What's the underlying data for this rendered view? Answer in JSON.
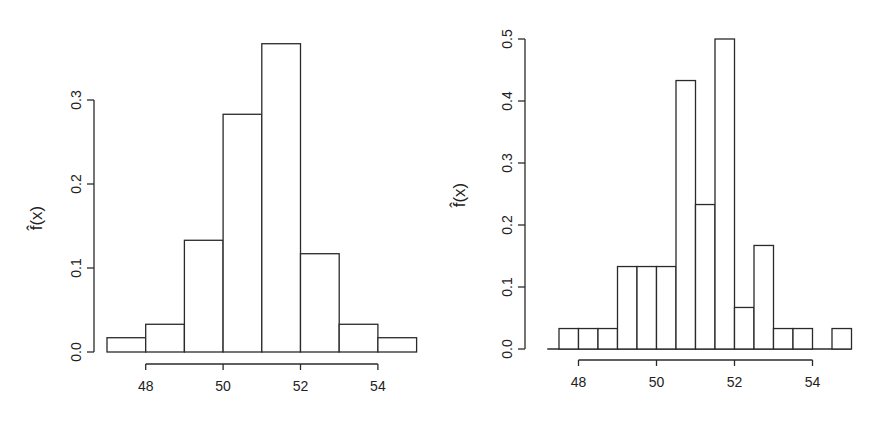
{
  "chart_data": [
    {
      "type": "bar",
      "subtype": "histogram",
      "title": "",
      "xlabel": "",
      "ylabel": "f̂(x)",
      "bin_width": 1,
      "bin_edges": [
        47,
        48,
        49,
        50,
        51,
        52,
        53,
        54,
        55
      ],
      "values": [
        0.017,
        0.033,
        0.133,
        0.283,
        0.367,
        0.117,
        0.033,
        0.017
      ],
      "xticks": [
        48,
        50,
        52,
        54
      ],
      "xtick_labels": [
        "48",
        "50",
        "52",
        "54"
      ],
      "yticks": [
        0.0,
        0.1,
        0.2,
        0.3
      ],
      "ytick_labels": [
        "0.0",
        "0.1",
        "0.2",
        "0.3"
      ],
      "xlim": [
        47,
        55
      ],
      "ylim": [
        0,
        0.37
      ],
      "grid": false
    },
    {
      "type": "bar",
      "subtype": "histogram",
      "title": "",
      "xlabel": "",
      "ylabel": "f̂(x)",
      "bin_width": 0.5,
      "bin_edges": [
        47.5,
        48,
        48.5,
        49,
        49.5,
        50,
        50.5,
        51,
        51.5,
        52,
        52.5,
        53,
        53.5,
        54,
        54.5,
        55
      ],
      "values": [
        0.033,
        0.033,
        0.033,
        0.133,
        0.133,
        0.133,
        0.433,
        0.233,
        0.5,
        0.067,
        0.167,
        0.033,
        0.033,
        0.0,
        0.033
      ],
      "xticks": [
        48,
        50,
        52,
        54
      ],
      "xtick_labels": [
        "48",
        "50",
        "52",
        "54"
      ],
      "yticks": [
        0.0,
        0.1,
        0.2,
        0.3,
        0.4,
        0.5
      ],
      "ytick_labels": [
        "0.0",
        "0.1",
        "0.2",
        "0.3",
        "0.4",
        "0.5"
      ],
      "xlim": [
        47.2,
        55
      ],
      "ylim": [
        0,
        0.5
      ],
      "grid": false
    }
  ],
  "layout": {
    "left": {
      "x0": 107,
      "x_per_unit": 38.7,
      "x_origin_value": 47,
      "y0": 352,
      "y_per_unit": 840,
      "yaxis_x": 94,
      "xaxis_y": 364,
      "ylabel_x": 42,
      "ylabel_y": 218
    },
    "right": {
      "x0": 559,
      "x_per_unit": 39,
      "x_origin_value": 47.5,
      "y0": 349,
      "y_per_unit": 620,
      "yaxis_x": 525,
      "xaxis_y": 360,
      "ylabel_x": 465,
      "ylabel_y": 195,
      "baseline_from": 47.2
    }
  }
}
